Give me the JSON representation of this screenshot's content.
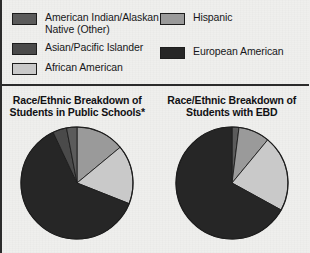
{
  "colors": {
    "background": "#efefed",
    "outline": "#1d1d1d",
    "text": "#17171a",
    "american_indian": "#5b5b5b",
    "asian_pacific": "#4a4a4a",
    "african_american": "#c9c9c9",
    "hispanic": "#9a9a9a",
    "european_american": "#262626"
  },
  "legend": {
    "left_items": [
      {
        "label": "American Indian/Alaskan\nNative (Other)",
        "color": "#5b5b5b",
        "swatch_name": "legend-swatch-american-indian"
      },
      {
        "label": "Asian/Pacific Islander",
        "color": "#4a4a4a",
        "swatch_name": "legend-swatch-asian-pacific"
      },
      {
        "label": "African American",
        "color": "#c9c9c9",
        "swatch_name": "legend-swatch-african-american"
      }
    ],
    "right_items": [
      {
        "label": "Hispanic",
        "color": "#9a9a9a",
        "swatch_name": "legend-swatch-hispanic"
      },
      {
        "label": "European American",
        "color": "#262626",
        "swatch_name": "legend-swatch-european-american"
      }
    ]
  },
  "chart_data": [
    {
      "type": "pie",
      "title": "Race/Ethnic Breakdown of\nStudents in Public Schools*",
      "categories": [
        "Hispanic",
        "African American",
        "European American",
        "Asian/Pacific Islander",
        "American Indian/Alaskan Native (Other)"
      ],
      "values": [
        14,
        17,
        62,
        4,
        3
      ],
      "colors": [
        "#9a9a9a",
        "#c9c9c9",
        "#262626",
        "#4a4a4a",
        "#5b5b5b"
      ],
      "start_angle": 0,
      "legend": "shared-top",
      "grid": false
    },
    {
      "type": "pie",
      "title": "Race/Ethnic Breakdown of\nStudents with EBD",
      "categories": [
        "American Indian/Alaskan Native (Other)",
        "Hispanic",
        "African American",
        "European American"
      ],
      "values": [
        2,
        9,
        22,
        67
      ],
      "colors": [
        "#5b5b5b",
        "#9a9a9a",
        "#c9c9c9",
        "#262626"
      ],
      "start_angle": 0,
      "legend": "shared-top",
      "grid": false
    }
  ]
}
